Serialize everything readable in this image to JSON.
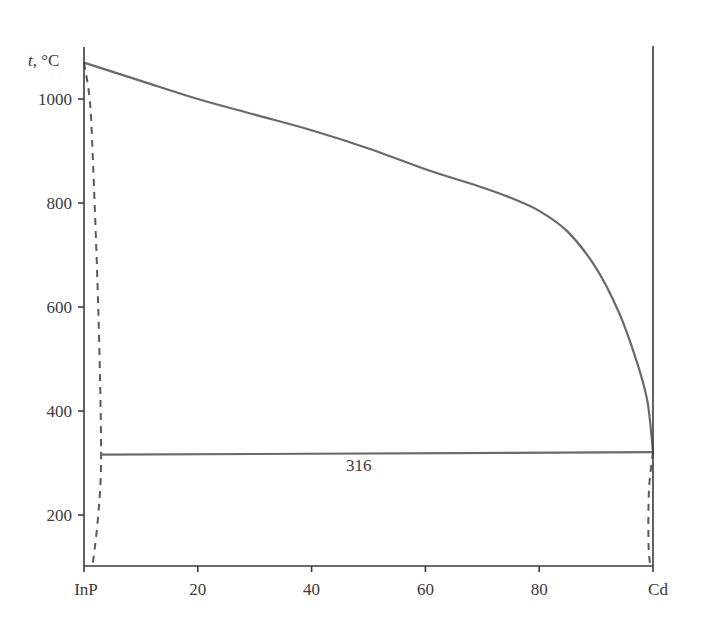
{
  "chart_data": {
    "type": "line",
    "title": "",
    "xlabel": "",
    "ylabel": "t, °C",
    "xlim": [
      0,
      100
    ],
    "ylim": [
      102,
      1100
    ],
    "grid": false,
    "x_ticks": [
      0,
      20,
      40,
      60,
      80,
      100
    ],
    "x_tick_labels": [
      "InP",
      "20",
      "40",
      "60",
      "80",
      "Cd"
    ],
    "y_ticks": [
      200,
      400,
      600,
      800,
      1000
    ],
    "y_tick_labels": [
      "200",
      "400",
      "600",
      "800",
      "1000"
    ],
    "series": [
      {
        "name": "liquidus",
        "style": "solid",
        "x": [
          0,
          10,
          20,
          30,
          40,
          50,
          60,
          70,
          75,
          80,
          85,
          90,
          94,
          97,
          99,
          100
        ],
        "y": [
          1070,
          1035,
          1000,
          970,
          940,
          905,
          865,
          830,
          810,
          785,
          745,
          675,
          590,
          500,
          420,
          321
        ]
      },
      {
        "name": "InP-side solvus",
        "style": "dashed",
        "x": [
          0,
          1,
          1.5,
          2.5,
          3,
          2.5,
          1.5
        ],
        "y": [
          1070,
          1000,
          900,
          600,
          321,
          200,
          102
        ]
      },
      {
        "name": "Cd-side solvus",
        "style": "dashed",
        "x": [
          100,
          99.3,
          99.2,
          99.5
        ],
        "y": [
          321,
          250,
          150,
          102
        ]
      },
      {
        "name": "eutectic line",
        "style": "solid",
        "x": [
          3,
          100
        ],
        "y": [
          316,
          321
        ]
      }
    ],
    "annotations": [
      {
        "text": "316",
        "x": 48,
        "y": 290
      }
    ]
  },
  "axis": {
    "y_label": "t, °C",
    "eutectic_label": "316"
  }
}
